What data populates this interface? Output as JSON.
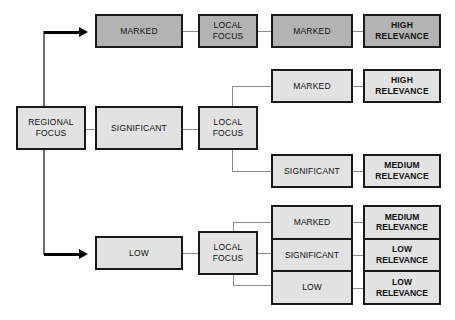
{
  "diagram": {
    "colors": {
      "fill_light": "#e2e2e2",
      "fill_dark": "#b3b3b3",
      "border": "#1a1a1a",
      "connector": "#8c8c8c",
      "arrow": "#000000",
      "background": "#ffffff"
    },
    "root": {
      "line1": "REGIONAL",
      "line2": "FOCUS"
    },
    "branch_top": {
      "level1": "MARKED",
      "local_focus_line1": "LOCAL",
      "local_focus_line2": "FOCUS",
      "level2": "MARKED",
      "outcome_line1": "HIGH",
      "outcome_line2": "RELEVANCE"
    },
    "branch_middle": {
      "level1": "SIGNIFICANT",
      "local_focus_line1": "LOCAL",
      "local_focus_line2": "FOCUS",
      "child_a": "MARKED",
      "child_a_outcome_line1": "HIGH",
      "child_a_outcome_line2": "RELEVANCE",
      "child_b": "SIGNIFICANT",
      "child_b_outcome_line1": "MEDIUM",
      "child_b_outcome_line2": "RELEVANCE"
    },
    "branch_bottom": {
      "level1": "LOW",
      "local_focus_line1": "LOCAL",
      "local_focus_line2": "FOCUS",
      "children": [
        {
          "label": "MARKED",
          "outcome_line1": "MEDIUM",
          "outcome_line2": "RELEVANCE"
        },
        {
          "label": "SIGNIFICANT",
          "outcome_line1": "LOW",
          "outcome_line2": "RELEVANCE"
        },
        {
          "label": "LOW",
          "outcome_line1": "LOW",
          "outcome_line2": "RELEVANCE"
        }
      ]
    }
  }
}
